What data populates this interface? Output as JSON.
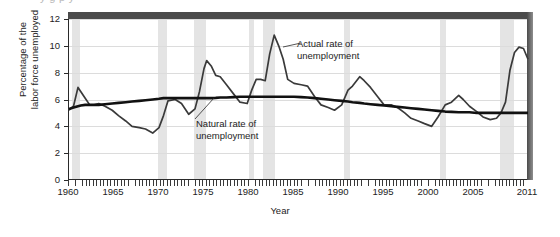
{
  "crop_remnant_text": "y            g       p    y",
  "axes": {
    "ylabel_line1": "Percentage of the",
    "ylabel_line2": "labor force unemployed",
    "xlabel": "Year",
    "yticks": [
      "0",
      "2",
      "4",
      "6",
      "8",
      "10",
      "12"
    ],
    "xticks": [
      "1960",
      "1965",
      "1970",
      "1975",
      "1980",
      "1985",
      "1990",
      "1995",
      "2000",
      "2005",
      "2011"
    ]
  },
  "annotations": {
    "actual_line1": "Actual rate of",
    "actual_line2": "unemployment",
    "natural_line1": "Natural rate of",
    "natural_line2": "unemployment"
  },
  "colors": {
    "actual_line": "#3a3a3a",
    "natural_line": "#111111",
    "recession_band": "#e4e4e4",
    "gridline": "#dcdcdc",
    "frame": "#2a2a2a",
    "top_band": "#4b4b4b"
  },
  "chart_data": {
    "type": "line",
    "title": "",
    "xlabel": "Year",
    "ylabel": "Percentage of the labor force unemployed",
    "xlim": [
      1960,
      2011
    ],
    "ylim": [
      0,
      12
    ],
    "ytick_values": [
      0,
      2,
      4,
      6,
      8,
      10,
      12
    ],
    "xtick_values": [
      1960,
      1965,
      1970,
      1975,
      1980,
      1985,
      1990,
      1995,
      2000,
      2005,
      2011
    ],
    "grid": "horizontal",
    "legend": "none (inline annotations)",
    "x": [
      1960,
      1960.5,
      1961,
      1961.3,
      1961.8,
      1962.3,
      1962.8,
      1963.3,
      1964,
      1964.8,
      1965.5,
      1966.3,
      1967,
      1967.8,
      1968.5,
      1969.3,
      1970,
      1970.5,
      1971,
      1971.8,
      1972.5,
      1973.3,
      1974,
      1974.5,
      1975,
      1975.3,
      1975.8,
      1976.3,
      1976.8,
      1977.5,
      1978.3,
      1979,
      1979.8,
      1980.3,
      1980.8,
      1981.3,
      1981.8,
      1982.3,
      1982.8,
      1983.3,
      1983.8,
      1984.3,
      1985,
      1985.8,
      1986.5,
      1987.3,
      1988,
      1988.8,
      1989.5,
      1990.3,
      1991,
      1991.5,
      1992.3,
      1992.8,
      1993.5,
      1994.3,
      1995,
      1995.8,
      1996.5,
      1997.3,
      1998,
      1998.8,
      1999.5,
      2000.3,
      2001,
      2001.8,
      2002.5,
      2003.3,
      2003.8,
      2004.5,
      2005.3,
      2006,
      2006.8,
      2007.5,
      2008,
      2008.5,
      2009,
      2009.5,
      2010,
      2010.5,
      2011
    ],
    "series": [
      {
        "name": "Actual rate of unemployment",
        "color": "#3a3a3a",
        "values": [
          5.2,
          5.5,
          6.9,
          6.6,
          6.1,
          5.6,
          5.6,
          5.7,
          5.5,
          5.2,
          4.8,
          4.4,
          4.0,
          3.9,
          3.8,
          3.5,
          3.9,
          4.8,
          5.9,
          6.0,
          5.7,
          4.9,
          5.3,
          6.6,
          8.3,
          8.9,
          8.5,
          7.8,
          7.7,
          7.1,
          6.4,
          5.8,
          5.7,
          6.7,
          7.5,
          7.5,
          7.4,
          9.4,
          10.8,
          10.0,
          9.0,
          7.5,
          7.2,
          7.1,
          7.0,
          6.2,
          5.6,
          5.4,
          5.2,
          5.6,
          6.7,
          7.0,
          7.7,
          7.4,
          6.9,
          6.2,
          5.6,
          5.6,
          5.4,
          5.0,
          4.6,
          4.4,
          4.2,
          4.0,
          4.7,
          5.6,
          5.8,
          6.3,
          6.0,
          5.5,
          5.1,
          4.7,
          4.5,
          4.6,
          5.0,
          5.8,
          8.2,
          9.5,
          9.9,
          9.8,
          9.0
        ]
      },
      {
        "name": "Natural rate of unemployment",
        "color": "#111111",
        "values": [
          5.3,
          5.4,
          5.5,
          5.55,
          5.6,
          5.6,
          5.6,
          5.6,
          5.65,
          5.7,
          5.75,
          5.8,
          5.85,
          5.9,
          5.95,
          6.0,
          6.05,
          6.1,
          6.1,
          6.1,
          6.1,
          6.1,
          6.1,
          6.1,
          6.1,
          6.1,
          6.1,
          6.12,
          6.15,
          6.15,
          6.18,
          6.2,
          6.2,
          6.2,
          6.2,
          6.2,
          6.2,
          6.2,
          6.2,
          6.2,
          6.2,
          6.2,
          6.2,
          6.18,
          6.15,
          6.1,
          6.05,
          6.0,
          5.95,
          5.9,
          5.85,
          5.8,
          5.75,
          5.7,
          5.65,
          5.6,
          5.55,
          5.5,
          5.45,
          5.4,
          5.35,
          5.3,
          5.25,
          5.2,
          5.15,
          5.1,
          5.08,
          5.05,
          5.05,
          5.05,
          5.0,
          5.0,
          5.0,
          5.0,
          5.0,
          5.0,
          5.0,
          5.0,
          5.0,
          5.0,
          5.0
        ]
      }
    ],
    "recession_bands": [
      {
        "start": 1960.3,
        "end": 1961.2
      },
      {
        "start": 1969.9,
        "end": 1970.9
      },
      {
        "start": 1973.9,
        "end": 1975.2
      },
      {
        "start": 1980.0,
        "end": 1980.6
      },
      {
        "start": 1981.5,
        "end": 1982.9
      },
      {
        "start": 1990.5,
        "end": 1991.2
      },
      {
        "start": 2001.2,
        "end": 2001.9
      },
      {
        "start": 2007.9,
        "end": 2009.5
      }
    ]
  }
}
